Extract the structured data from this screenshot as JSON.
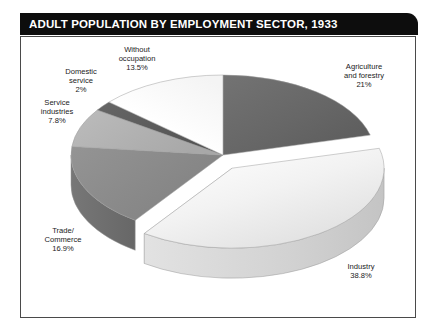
{
  "header": {
    "title": "ADULT POPULATION BY EMPLOYMENT SECTOR, 1933",
    "background": "#0d0d0d",
    "text_color": "#ffffff"
  },
  "panel": {
    "background": "#ffffff",
    "border_color": "#4a4a4a"
  },
  "chart_data": {
    "type": "pie",
    "title": "ADULT POPULATION BY EMPLOYMENT SECTOR, 1933",
    "subtitle": "",
    "xlabel": "",
    "ylabel": "",
    "units": "percent",
    "three_d": true,
    "exploded_slice": "Industry",
    "legend_position": "none",
    "labels_inline": true,
    "categories": [
      "Agriculture and forestry",
      "Industry",
      "Trade/Commerce",
      "Service industries",
      "Domestic service",
      "Without occupation"
    ],
    "values": [
      21,
      38.8,
      16.9,
      7.8,
      2,
      13.5
    ],
    "slices": [
      {
        "name": "Agriculture and forestry",
        "line1": "Agriculture",
        "line2": "and forestry",
        "percent_label": "21%",
        "value": 21,
        "color": "#6a6a6a",
        "side_color": "#4e4e4e",
        "exploded": false
      },
      {
        "name": "Industry",
        "line1": "Industry",
        "line2": "",
        "percent_label": "38.8%",
        "value": 38.8,
        "color": "#efefef",
        "side_color": "#cfcfcf",
        "exploded": true
      },
      {
        "name": "Trade/Commerce",
        "line1": "Trade/",
        "line2": "Commerce",
        "percent_label": "16.9%",
        "value": 16.9,
        "color": "#8a8a8a",
        "side_color": "#6d6d6d",
        "exploded": false
      },
      {
        "name": "Service industries",
        "line1": "Service",
        "line2": "industries",
        "percent_label": "7.8%",
        "value": 7.8,
        "color": "#b2b2b2",
        "side_color": "#949494",
        "exploded": false
      },
      {
        "name": "Domestic service",
        "line1": "Domestic",
        "line2": "service",
        "percent_label": "2%",
        "value": 2,
        "color": "#5c5c5c",
        "side_color": "#454545",
        "exploded": false
      },
      {
        "name": "Without occupation",
        "line1": "Without",
        "line2": "occupation",
        "percent_label": "13.5%",
        "value": 13.5,
        "color": "#fbfbfb",
        "side_color": "#dcdcdc",
        "exploded": false
      }
    ]
  }
}
